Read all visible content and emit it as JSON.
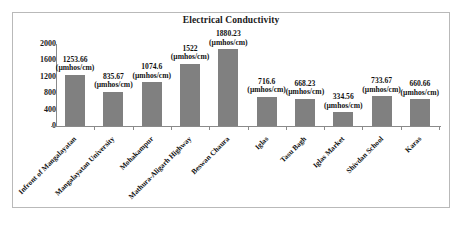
{
  "chart_data": {
    "type": "bar",
    "title": "Electrical Conductivity",
    "xlabel": "",
    "ylabel": "",
    "unit": "(µmhos/cm)",
    "ylim": [
      0,
      2000
    ],
    "yticks": [
      0,
      400,
      800,
      1200,
      1600,
      2000
    ],
    "grid": false,
    "legend": false,
    "bar_color": "#808080",
    "categories": [
      "Infront of Mangalayatan",
      "Mangalayatan University",
      "Mohakampur",
      "Mathura-Aligarh Highway",
      "Beswan Chaura",
      "Iglas",
      "Tasu Bagh",
      "Iglas Market",
      "Shivdan School",
      "Karas"
    ],
    "values": [
      1253.66,
      835.67,
      1074.6,
      1522,
      1880.23,
      716.6,
      668.23,
      334.56,
      733.67,
      660.66
    ],
    "value_labels": [
      "1253.66",
      "835.67",
      "1074.6",
      "1522",
      "1880.23",
      "716.6",
      "668.23",
      "334.56",
      "733.67",
      "660.66"
    ]
  }
}
